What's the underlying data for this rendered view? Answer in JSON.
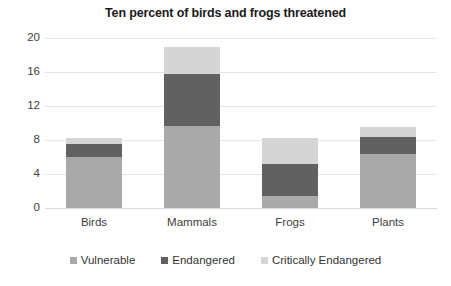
{
  "chart_data": {
    "type": "bar",
    "subtype": "stacked-column",
    "title": "Ten percent of birds and frogs threatened",
    "xlabel": "",
    "ylabel": "",
    "categories": [
      "Birds",
      "Mammals",
      "Frogs",
      "Plants"
    ],
    "series": [
      {
        "name": "Vulnerable",
        "color": "#a9a9a9",
        "values": [
          6.0,
          9.6,
          1.4,
          6.4
        ]
      },
      {
        "name": "Endangered",
        "color": "#616161",
        "values": [
          1.5,
          6.2,
          3.8,
          1.9
        ]
      },
      {
        "name": "Critically Endangered",
        "color": "#d5d5d5",
        "values": [
          0.7,
          3.2,
          3.0,
          1.2
        ]
      }
    ],
    "totals": [
      8.2,
      19.0,
      8.2,
      9.5
    ],
    "ylim": [
      0,
      20
    ],
    "yticks": [
      0,
      4,
      8,
      12,
      16,
      20
    ],
    "ytick_labels": [
      "0",
      "4",
      "8",
      "12",
      "16",
      "20"
    ],
    "grid": true,
    "legend_position": "bottom"
  },
  "legend": {
    "items": [
      {
        "label": "Vulnerable",
        "color": "#a9a9a9"
      },
      {
        "label": "Endangered",
        "color": "#616161"
      },
      {
        "label": "Critically Endangered",
        "color": "#d5d5d5"
      }
    ]
  }
}
